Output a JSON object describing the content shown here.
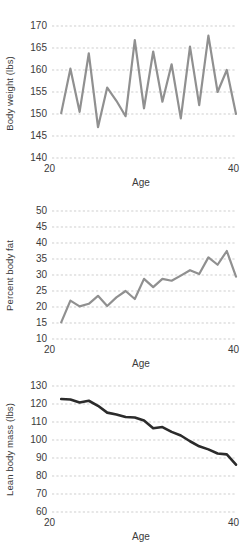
{
  "figure": {
    "panel_count": 3
  },
  "chart_data": [
    {
      "id": "body-weight",
      "type": "line",
      "title": "",
      "xlabel": "Age",
      "ylabel": "Body weight (lbs)",
      "xlim": [
        20,
        40
      ],
      "ylim": [
        140,
        170
      ],
      "xticks": [
        20,
        40
      ],
      "xticklabels": [
        "20",
        "40"
      ],
      "yticks": [
        140,
        145,
        150,
        155,
        160,
        165,
        170
      ],
      "yticklabels": [
        "140",
        "145",
        "150",
        "155",
        "160",
        "165",
        "170"
      ],
      "grid": true,
      "grid_axis": "y",
      "legend": "none",
      "line_color": "#909090",
      "line_width": 2.2,
      "x": [
        21,
        22,
        23,
        24,
        25,
        26,
        27,
        28,
        29,
        30,
        31,
        32,
        33,
        34,
        35,
        36,
        37,
        38,
        39,
        40
      ],
      "series": [
        {
          "name": "Body weight",
          "values": [
            150.2,
            160.3,
            150.5,
            163.8,
            147.0,
            156.0,
            153.0,
            149.5,
            166.8,
            151.3,
            164.2,
            152.8,
            161.3,
            149.0,
            165.3,
            152.0,
            167.8,
            155.0,
            160.0,
            150.0
          ]
        }
      ]
    },
    {
      "id": "percent-body-fat",
      "type": "line",
      "title": "",
      "xlabel": "Age",
      "ylabel": "Percent body fat",
      "xlim": [
        20,
        40
      ],
      "ylim": [
        10,
        50
      ],
      "xticks": [
        20,
        40
      ],
      "xticklabels": [
        "20",
        "40"
      ],
      "yticks": [
        10,
        15,
        20,
        25,
        30,
        35,
        40,
        45,
        50
      ],
      "yticklabels": [
        "10",
        "15",
        "20",
        "25",
        "30",
        "35",
        "40",
        "45",
        "50"
      ],
      "grid": true,
      "grid_axis": "y",
      "legend": "none",
      "line_color": "#909090",
      "line_width": 2.2,
      "x": [
        21,
        22,
        23,
        24,
        25,
        26,
        27,
        28,
        29,
        30,
        31,
        32,
        33,
        34,
        35,
        36,
        37,
        38,
        39,
        40
      ],
      "series": [
        {
          "name": "Percent body fat",
          "values": [
            15.2,
            22.0,
            20.2,
            21.0,
            23.5,
            20.3,
            23.0,
            25.0,
            22.5,
            28.8,
            26.2,
            28.8,
            28.2,
            29.8,
            31.5,
            30.3,
            35.5,
            33.2,
            37.5,
            29.5
          ]
        }
      ]
    },
    {
      "id": "lean-body-mass",
      "type": "line",
      "title": "",
      "xlabel": "Age",
      "ylabel": "Lean body mass (lbs)",
      "xlim": [
        20,
        40
      ],
      "ylim": [
        60,
        130
      ],
      "xticks": [
        20,
        40
      ],
      "xticklabels": [
        "20",
        "40"
      ],
      "yticks": [
        60,
        70,
        80,
        90,
        100,
        110,
        120,
        130
      ],
      "yticklabels": [
        "60",
        "70",
        "80",
        "90",
        "100",
        "110",
        "120",
        "130"
      ],
      "grid": true,
      "grid_axis": "y",
      "legend": "none",
      "line_color": "#2b2b2b",
      "line_width": 2.6,
      "x": [
        21,
        22,
        23,
        24,
        25,
        26,
        27,
        28,
        29,
        30,
        31,
        32,
        33,
        34,
        35,
        36,
        37,
        38,
        39,
        40
      ],
      "series": [
        {
          "name": "Lean body mass",
          "values": [
            122.8,
            122.5,
            120.8,
            121.8,
            119.0,
            115.2,
            114.2,
            112.8,
            112.5,
            110.8,
            106.5,
            107.2,
            104.5,
            102.5,
            99.3,
            96.5,
            94.8,
            92.5,
            92.0,
            86.3
          ]
        }
      ]
    }
  ]
}
